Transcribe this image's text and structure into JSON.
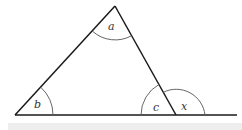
{
  "diagram": {
    "type": "triangle-exterior-angle",
    "colors": {
      "line": "#1a1a1a",
      "arc": "#555555",
      "label": "#333333",
      "band": "#eeeeee"
    },
    "vertices": {
      "top": {
        "x": 115,
        "y": 6
      },
      "left": {
        "x": 15,
        "y": 115
      },
      "right": {
        "x": 176,
        "y": 115
      }
    },
    "baseline_end_x": 237,
    "angle_labels": {
      "a": "a",
      "b": "b",
      "c": "c",
      "x": "x"
    }
  }
}
